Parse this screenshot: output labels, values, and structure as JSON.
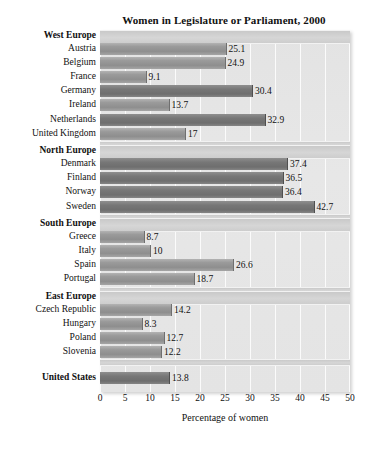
{
  "chart_data": {
    "type": "bar",
    "orientation": "horizontal",
    "title": "Women in Legislature or Parliament, 2000",
    "xlabel": "Percentage of women",
    "ylabel": "",
    "xlim": [
      0,
      50
    ],
    "xticks": [
      0,
      5,
      10,
      15,
      20,
      25,
      30,
      35,
      40,
      45,
      50
    ],
    "xtick_labels": [
      "0",
      "5",
      "10",
      "15",
      "20",
      "25",
      "30",
      "35",
      "40",
      "45",
      "50"
    ],
    "grid": true,
    "grid_axis": "x",
    "legend": null,
    "groups": [
      {
        "name": "West Europe",
        "categories": [
          "Austria",
          "Belgium",
          "France",
          "Germany",
          "Ireland",
          "Netherlands",
          "United Kingdom"
        ],
        "values": [
          25.1,
          24.9,
          9.1,
          30.4,
          13.7,
          32.9,
          17
        ],
        "value_labels": [
          "25.1",
          "24.9",
          "9.1",
          "30.4",
          "13.7",
          "32.9",
          "17"
        ]
      },
      {
        "name": "North Europe",
        "categories": [
          "Denmark",
          "Finland",
          "Norway",
          "Sweden"
        ],
        "values": [
          37.4,
          36.5,
          36.4,
          42.7
        ],
        "value_labels": [
          "37.4",
          "36.5",
          "36.4",
          "42.7"
        ]
      },
      {
        "name": "South Europe",
        "categories": [
          "Greece",
          "Italy",
          "Spain",
          "Portugal"
        ],
        "values": [
          8.7,
          10,
          26.6,
          18.7
        ],
        "value_labels": [
          "8.7",
          "10",
          "26.6",
          "18.7"
        ]
      },
      {
        "name": "East Europe",
        "categories": [
          "Czech Republic",
          "Hungary",
          "Poland",
          "Slovenia"
        ],
        "values": [
          14.2,
          8.3,
          12.7,
          12.2
        ],
        "value_labels": [
          "14.2",
          "8.3",
          "12.7",
          "12.2"
        ]
      },
      {
        "name": "United States",
        "is_single": true,
        "categories": [
          "United States"
        ],
        "values": [
          13.8
        ],
        "value_labels": [
          "13.8"
        ]
      }
    ],
    "colors": {
      "panel_background": "#e5e5e5",
      "bar_fill": "#9a9a9a",
      "bar_fill_dark": "#777777",
      "gridline": "#fbfbfb",
      "band_fill": "#d0d0d0",
      "text": "#111111"
    }
  }
}
